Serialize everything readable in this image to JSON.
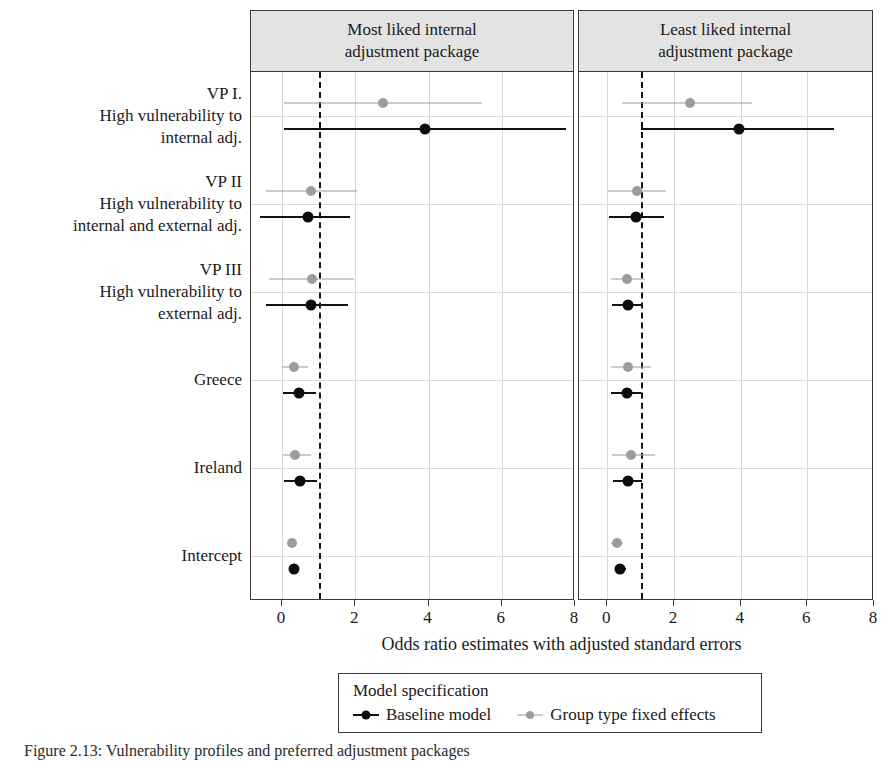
{
  "figure": {
    "caption": "Figure 2.13: Vulnerability profiles and preferred adjustment packages"
  },
  "panels": [
    {
      "key": "most",
      "title_line1": "Most liked internal",
      "title_line2": "adjustment package"
    },
    {
      "key": "least",
      "title_line1": "Least liked internal",
      "title_line2": "adjustment package"
    }
  ],
  "axis": {
    "x_title": "Odds ratio estimates with adjusted standard errors",
    "x_ticks": [
      0,
      2,
      4,
      6,
      8
    ],
    "x_tick_labels": [
      "0",
      "2",
      "4",
      "6",
      "8"
    ],
    "xlim": [
      -0.85,
      8.0
    ],
    "reference_line_value": 1,
    "grid": "vertical minor + horizontal per-term"
  },
  "terms": [
    {
      "id": "vp1",
      "label": "VP I.\nHigh vulnerability to\ninternal adj."
    },
    {
      "id": "vp2",
      "label": "VP II\nHigh vulnerability to\ninternal and external adj."
    },
    {
      "id": "vp3",
      "label": "VP III\nHigh vulnerability to\nexternal adj."
    },
    {
      "id": "greece",
      "label": "Greece"
    },
    {
      "id": "ireland",
      "label": "Ireland"
    },
    {
      "id": "intercept",
      "label": "Intercept"
    }
  ],
  "legend": {
    "title": "Model specification",
    "entries": [
      {
        "key": "baseline",
        "label": "Baseline model",
        "color": "#0d0d0d"
      },
      {
        "key": "grouptype",
        "label": "Group type fixed effects",
        "color": "#9c9c9c"
      }
    ]
  },
  "chart_data": {
    "type": "scatter",
    "title": "",
    "subtitle": "",
    "xlabel": "Odds ratio estimates with adjusted standard errors",
    "ylabel": "",
    "xlim": [
      -0.85,
      8.0
    ],
    "xticks": [
      0,
      2,
      4,
      6,
      8
    ],
    "grid": true,
    "legend_position": "bottom",
    "reference_line": 1,
    "categories": [
      "VP I. High vulnerability to internal adj.",
      "VP II High vulnerability to internal and external adj.",
      "VP III High vulnerability to external adj.",
      "Greece",
      "Ireland",
      "Intercept"
    ],
    "facets": [
      {
        "name": "Most liked internal adjustment package",
        "series": [
          {
            "name": "Group type fixed effects",
            "color": "#9c9c9c",
            "points": [
              {
                "category": "VP I. High vulnerability to internal adj.",
                "estimate": 2.75,
                "low": 0.05,
                "high": 5.45
              },
              {
                "category": "VP II High vulnerability to internal and external adj.",
                "estimate": 0.8,
                "low": -0.45,
                "high": 2.05
              },
              {
                "category": "VP III High vulnerability to external adj.",
                "estimate": 0.82,
                "low": -0.35,
                "high": 1.95
              },
              {
                "category": "Greece",
                "estimate": 0.33,
                "low": 0.0,
                "high": 0.72
              },
              {
                "category": "Ireland",
                "estimate": 0.36,
                "low": 0.02,
                "high": 0.78
              },
              {
                "category": "Intercept",
                "estimate": 0.26,
                "low": 0.18,
                "high": 0.34
              }
            ]
          },
          {
            "name": "Baseline model",
            "color": "#0d0d0d",
            "points": [
              {
                "category": "VP I. High vulnerability to internal adj.",
                "estimate": 3.9,
                "low": 0.05,
                "high": 7.75
              },
              {
                "category": "VP II High vulnerability to internal and external adj.",
                "estimate": 0.72,
                "low": -0.6,
                "high": 1.85
              },
              {
                "category": "VP III High vulnerability to external adj.",
                "estimate": 0.78,
                "low": -0.45,
                "high": 1.8
              },
              {
                "category": "Greece",
                "estimate": 0.46,
                "low": 0.03,
                "high": 0.92
              },
              {
                "category": "Ireland",
                "estimate": 0.48,
                "low": 0.05,
                "high": 0.95
              },
              {
                "category": "Intercept",
                "estimate": 0.33,
                "low": 0.22,
                "high": 0.45
              }
            ]
          }
        ]
      },
      {
        "name": "Least liked internal adjustment package",
        "series": [
          {
            "name": "Group type fixed effects",
            "color": "#9c9c9c",
            "points": [
              {
                "category": "VP I. High vulnerability to internal adj.",
                "estimate": 2.48,
                "low": 0.45,
                "high": 4.35
              },
              {
                "category": "VP II High vulnerability to internal and external adj.",
                "estimate": 0.88,
                "low": 0.02,
                "high": 1.75
              },
              {
                "category": "VP III High vulnerability to external adj.",
                "estimate": 0.6,
                "low": 0.1,
                "high": 1.12
              },
              {
                "category": "Greece",
                "estimate": 0.62,
                "low": 0.12,
                "high": 1.3
              },
              {
                "category": "Ireland",
                "estimate": 0.7,
                "low": 0.15,
                "high": 1.42
              },
              {
                "category": "Intercept",
                "estimate": 0.3,
                "low": 0.12,
                "high": 0.48
              }
            ]
          },
          {
            "name": "Baseline model",
            "color": "#0d0d0d",
            "points": [
              {
                "category": "VP I. High vulnerability to internal adj.",
                "estimate": 3.95,
                "low": 1.0,
                "high": 6.8
              },
              {
                "category": "VP II High vulnerability to internal and external adj.",
                "estimate": 0.85,
                "low": 0.05,
                "high": 1.7
              },
              {
                "category": "VP III High vulnerability to external adj.",
                "estimate": 0.62,
                "low": 0.15,
                "high": 1.08
              },
              {
                "category": "Greece",
                "estimate": 0.58,
                "low": 0.12,
                "high": 1.02
              },
              {
                "category": "Ireland",
                "estimate": 0.62,
                "low": 0.18,
                "high": 1.05
              },
              {
                "category": "Intercept",
                "estimate": 0.38,
                "low": 0.22,
                "high": 0.55
              }
            ]
          }
        ]
      }
    ]
  }
}
